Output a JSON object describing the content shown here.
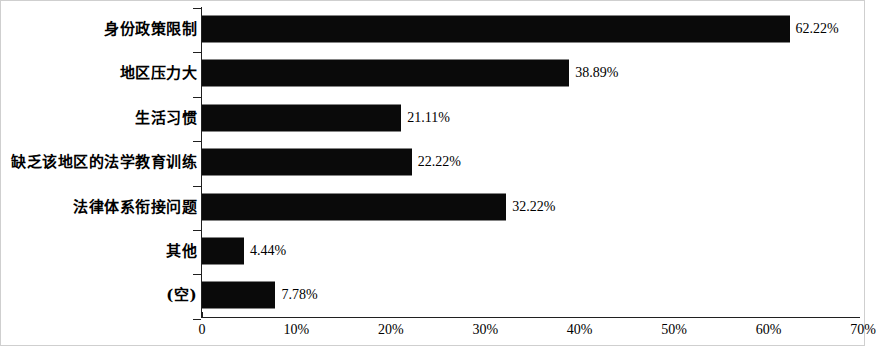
{
  "chart_data": {
    "type": "bar",
    "orientation": "horizontal",
    "title": "",
    "subtitle": "",
    "xlabel": "",
    "ylabel": "",
    "grid": false,
    "legend": false,
    "legend_position": "none",
    "xlim": [
      0,
      70
    ],
    "xtick_labels": [
      "0",
      "10%",
      "20%",
      "30%",
      "40%",
      "50%",
      "60%",
      "70%"
    ],
    "xtick_values": [
      0,
      10,
      20,
      30,
      40,
      50,
      60,
      70
    ],
    "categories": [
      "身份政策限制",
      "地区压力大",
      "生活习惯",
      "缺乏该地区的法学教育训练",
      "法律体系衔接问题",
      "其他",
      "(空)"
    ],
    "values": [
      62.22,
      38.89,
      21.11,
      22.22,
      32.22,
      4.44,
      7.78
    ],
    "value_labels": [
      "62.22%",
      "38.89%",
      "21.11%",
      "22.22%",
      "32.22%",
      "4.44%",
      "7.78%"
    ],
    "bar_color": "#0a0a0a",
    "axis_color": "#202020",
    "background_color": "#ffffff"
  },
  "rows": [
    {
      "label": "身份政策限制",
      "value": 62.22,
      "value_label": "62.22%"
    },
    {
      "label": "地区压力大",
      "value": 38.89,
      "value_label": "38.89%"
    },
    {
      "label": "生活习惯",
      "value": 21.11,
      "value_label": "21.11%"
    },
    {
      "label": "缺乏该地区的法学教育训练",
      "value": 22.22,
      "value_label": "22.22%"
    },
    {
      "label": "法律体系衔接问题",
      "value": 32.22,
      "value_label": "32.22%"
    },
    {
      "label": "其他",
      "value": 4.44,
      "value_label": "4.44%"
    },
    {
      "label": "(空)",
      "value": 7.78,
      "value_label": "7.78%"
    }
  ],
  "xaxis": {
    "ticks": [
      {
        "label": "0",
        "value": 0
      },
      {
        "label": "10%",
        "value": 10
      },
      {
        "label": "20%",
        "value": 20
      },
      {
        "label": "30%",
        "value": 30
      },
      {
        "label": "40%",
        "value": 40
      },
      {
        "label": "50%",
        "value": 50
      },
      {
        "label": "60%",
        "value": 60
      },
      {
        "label": "70%",
        "value": 70
      }
    ]
  }
}
